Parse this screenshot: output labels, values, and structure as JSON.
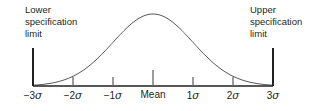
{
  "figure": {
    "background_color": "#ffffff",
    "line_color": "#58595b",
    "axis_color": "#231f20",
    "text_color": "#231f20",
    "width": 329,
    "height": 111
  },
  "annotations": {
    "lower_spec_limit": {
      "line1": "Lower",
      "line2": "specification",
      "line3": "limit"
    },
    "upper_spec_limit": {
      "line1": "Upper",
      "line2": "specification",
      "line3": "limit"
    }
  },
  "chart_data": {
    "type": "line",
    "title": "",
    "subtitle": "",
    "xlabel": "",
    "ylabel": "",
    "grid": false,
    "legend": false,
    "distribution": "normal",
    "mean": 0,
    "sigma": 1,
    "xlim": [
      -3,
      3
    ],
    "ylim": [
      0,
      1
    ],
    "tick_values": [
      -3,
      -2,
      -1,
      0,
      1,
      2,
      3
    ],
    "tick_labels": [
      {
        "sign": "−3",
        "symbol": "σ",
        "text": "−3σ"
      },
      {
        "sign": "−2",
        "symbol": "σ",
        "text": "−2σ"
      },
      {
        "sign": "−1",
        "symbol": "σ",
        "text": "−1σ"
      },
      {
        "sign": "Mean",
        "symbol": "",
        "text": "Mean"
      },
      {
        "sign": "1",
        "symbol": "σ",
        "text": "1σ"
      },
      {
        "sign": "2",
        "symbol": "σ",
        "text": "2σ"
      },
      {
        "sign": "3",
        "symbol": "σ",
        "text": "3σ"
      }
    ],
    "x": [
      -3.0,
      -2.8,
      -2.6,
      -2.4,
      -2.2,
      -2.0,
      -1.8,
      -1.6,
      -1.4,
      -1.2,
      -1.0,
      -0.8,
      -0.6,
      -0.4,
      -0.2,
      0.0,
      0.2,
      0.4,
      0.6,
      0.8,
      1.0,
      1.2,
      1.4,
      1.6,
      1.8,
      2.0,
      2.2,
      2.4,
      2.6,
      2.8,
      3.0
    ],
    "y": [
      0.011,
      0.019,
      0.034,
      0.056,
      0.089,
      0.135,
      0.198,
      0.278,
      0.375,
      0.487,
      0.607,
      0.726,
      0.835,
      0.923,
      0.98,
      1.0,
      0.98,
      0.923,
      0.835,
      0.726,
      0.607,
      0.487,
      0.375,
      0.278,
      0.198,
      0.135,
      0.089,
      0.056,
      0.034,
      0.019,
      0.011
    ],
    "spec_limits": {
      "lower": -3,
      "upper": 3
    }
  }
}
